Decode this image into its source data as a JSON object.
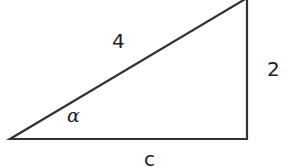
{
  "diagram": {
    "type": "right-triangle",
    "stroke_color": "#333333",
    "background": "#ffffff",
    "vertices": {
      "bottom_left": [
        10,
        139
      ],
      "bottom_right": [
        247,
        139
      ],
      "top_right": [
        247,
        0
      ]
    },
    "labels": {
      "hypotenuse": "4",
      "vertical_side": "2",
      "base": "c",
      "angle": "α"
    }
  }
}
